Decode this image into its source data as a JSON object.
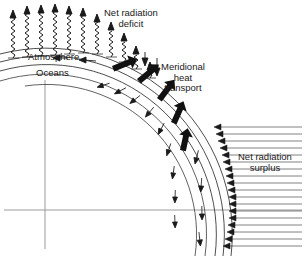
{
  "figure": {
    "background": "#ffffff",
    "ink": "#1a1a1a"
  },
  "labels": {
    "deficit": "Net radiation\ndeficit",
    "meridional": "Meridional\nheat\ntransport",
    "surplus": "Net radiation\nsurplus",
    "atmosphere": "Atmosphere",
    "oceans": "Oceans"
  },
  "diagram_data": {
    "type": "schematic",
    "description": "Quarter-globe cross-section with curved atmosphere and ocean layers. Wavy outgoing radiation arrows at high latitude (deficit), incoming horizontal radiation arrows at low latitude (surplus), and thick poleward meridional heat transport arrows within the atmosphere and ocean layers.",
    "globe": {
      "center_x": 45,
      "center_y": 210,
      "surface_radius": 178,
      "layer_radii": [
        150,
        160,
        170,
        178,
        186
      ],
      "layer_names": [
        "deep-ocean",
        "ocean",
        "surface",
        "lower-atmosphere",
        "upper-atmosphere"
      ]
    },
    "axes": {
      "equator_line": {
        "y": 210,
        "x_start": 4,
        "x_end": 302
      },
      "polar_axis": {
        "x": 45,
        "y_start": 80,
        "y_end": 249
      }
    },
    "outgoing_radiation_arrows": {
      "count": 11,
      "style": "wavy-shaft-up-arrow",
      "direction": "outward-up",
      "region": "high-latitude",
      "meaning": "net radiation deficit",
      "x_positions": [
        13,
        27,
        41,
        55,
        69,
        83,
        97,
        111,
        124,
        136,
        148
      ],
      "tail_y": [
        58,
        57,
        56,
        55,
        54,
        53,
        52,
        54,
        59,
        65,
        73
      ],
      "head_y": [
        12,
        8,
        6,
        5,
        5,
        6,
        8,
        13,
        22,
        34,
        48
      ]
    },
    "incoming_radiation_arrows": {
      "count": 17,
      "style": "solid-head-long-tail",
      "direction": "inward-left",
      "region": "low-latitude",
      "meaning": "net radiation surplus",
      "tail_x": 302,
      "head_y_start": 126,
      "head_y_end": 246
    },
    "meridional_transport_arrows": {
      "atmosphere": {
        "count": 5,
        "weight": "thick",
        "direction": "poleward"
      },
      "ocean": {
        "count": 9,
        "weight": "thin",
        "direction": "poleward"
      }
    }
  }
}
